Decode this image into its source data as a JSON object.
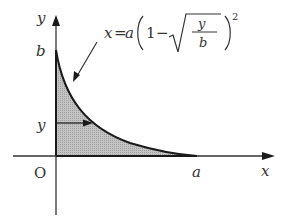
{
  "diagram": {
    "axes": {
      "x_label": "x",
      "y_label": "y",
      "origin_label": "O"
    },
    "points": {
      "y_intercept_label": "b",
      "x_intercept_label": "a",
      "strip_label": "y"
    },
    "curve_equation": {
      "lhs": "x",
      "equals": "=",
      "coef": "a",
      "one": "1",
      "minus": "−",
      "frac_num": "y",
      "frac_den": "b",
      "exponent": "2"
    },
    "colors": {
      "shade": "#bdbdbd",
      "stroke": "#1a1a1a",
      "text": "#333333"
    }
  }
}
